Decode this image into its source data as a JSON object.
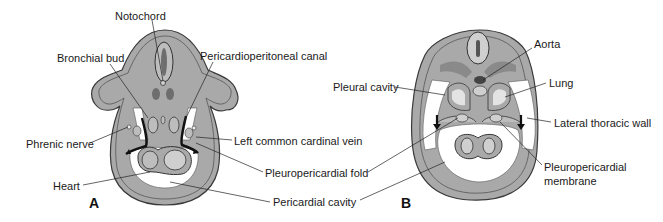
{
  "panels": {
    "A": {
      "letter": "A",
      "labels": {
        "notochord": "Notochord",
        "bronchial_bud": "Bronchial bud",
        "pericardioperitoneal_canal": "Pericardioperitoneal canal",
        "phrenic_nerve": "Phrenic nerve",
        "left_common_cardinal_vein": "Left common cardinal vein",
        "pleuropericardial_fold": "Pleuropericardial fold",
        "heart": "Heart",
        "pericardial_cavity": "Pericardial cavity"
      }
    },
    "B": {
      "letter": "B",
      "labels": {
        "aorta": "Aorta",
        "pleural_cavity": "Pleural cavity",
        "lung": "Lung",
        "lateral_thoracic_wall": "Lateral thoracic wall",
        "pleuropericardial_membrane_line1": "Pleuropericardial",
        "pleuropericardial_membrane_line2": "membrane"
      }
    }
  },
  "colors": {
    "tissue_gray": "#a9a9a9",
    "light_gray": "#cfcfcf",
    "dark_gray": "#6e6e6e",
    "outline": "#3a3a3a",
    "cavity_white": "#ffffff"
  }
}
